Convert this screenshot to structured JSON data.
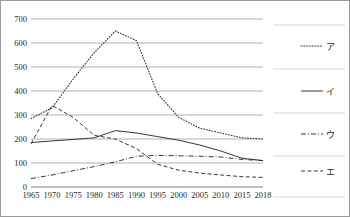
{
  "chart_data": {
    "type": "line",
    "title": "",
    "xlabel": "",
    "ylabel": "",
    "grid": true,
    "legend_position": "right",
    "ylim": [
      0,
      700
    ],
    "ytick_values": [
      0,
      100,
      200,
      300,
      400,
      500,
      600,
      700
    ],
    "ytick_labels": [
      "0",
      "100",
      "200",
      "300",
      "400",
      "500",
      "600",
      "700"
    ],
    "categories": [
      "1965",
      "1970",
      "1975",
      "1980",
      "1985",
      "1990",
      "1995",
      "2000",
      "2005",
      "2010",
      "2015",
      "2018"
    ],
    "x": [
      1965,
      1970,
      1975,
      1980,
      1985,
      1990,
      1995,
      2000,
      2005,
      2010,
      2015,
      2018
    ],
    "series": [
      {
        "name": "ア",
        "style": "dotted",
        "values": [
          285,
          330,
          450,
          560,
          650,
          610,
          390,
          290,
          245,
          225,
          205,
          200
        ]
      },
      {
        "name": "イ",
        "style": "solid",
        "values": [
          185,
          192,
          198,
          205,
          235,
          225,
          210,
          195,
          175,
          150,
          120,
          110
        ]
      },
      {
        "name": "ウ",
        "style": "dash-dot",
        "values": [
          35,
          50,
          68,
          85,
          105,
          128,
          132,
          130,
          128,
          125,
          115,
          110
        ]
      },
      {
        "name": "エ",
        "style": "dashed",
        "values": [
          180,
          340,
          290,
          215,
          200,
          160,
          95,
          70,
          58,
          50,
          43,
          40
        ]
      }
    ]
  },
  "legend": {
    "items": [
      {
        "label": "ア",
        "style": "dotted"
      },
      {
        "label": "イ",
        "style": "solid"
      },
      {
        "label": "ウ",
        "style": "dash-dot"
      },
      {
        "label": "エ",
        "style": "dashed"
      }
    ]
  }
}
